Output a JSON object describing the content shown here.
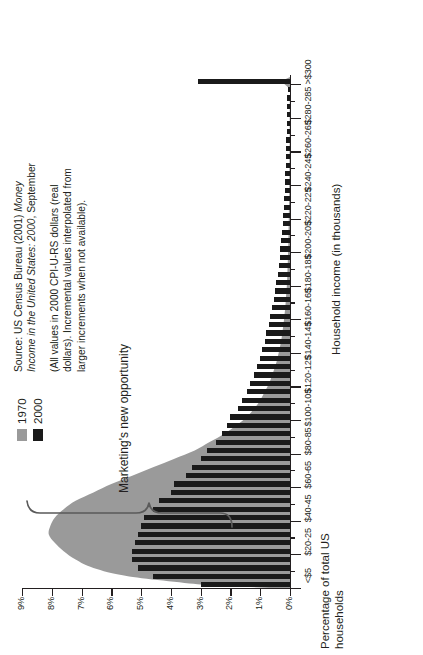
{
  "legend": {
    "items": [
      {
        "label": "1970",
        "color": "#9a9a9a"
      },
      {
        "label": "2000",
        "color": "#1a1a1a"
      }
    ]
  },
  "source_note": {
    "paragraph1_prefix": "Source: US Census Bureau (2001) ",
    "paragraph1_italic": "Money Income in the United States: 2000",
    "paragraph1_suffix": ", September",
    "paragraph2": "(All values in 2000 CPI-U-RS dollars (real dollars). Incremental values interpolated from larger increments when not available)."
  },
  "annotation": {
    "label": "Marketing's new opportunity"
  },
  "chart_data": {
    "type": "bar",
    "title": "",
    "xlabel": "Household income (in thousands)",
    "ylabel": "Percentage of total US households",
    "ylim": [
      0,
      9
    ],
    "ytick_labels": [
      "0%",
      "1%",
      "2%",
      "3%",
      "4%",
      "5%",
      "6%",
      "7%",
      "8%",
      "9%"
    ],
    "ytick_values": [
      0,
      1,
      2,
      3,
      4,
      5,
      6,
      7,
      8,
      9
    ],
    "grid": false,
    "legend_position": "top-right",
    "xtick_labels": [
      "<$5",
      "$20-25",
      "$40-45",
      "$60-65",
      "$80-85",
      "$100-105",
      "$120-125",
      "$140-145",
      "$160-165",
      "$180-185",
      "$200-205",
      "$220-225",
      "$240-245",
      "$260-265",
      "$280-285",
      ">$300"
    ],
    "xtick_positions": [
      0,
      4,
      8,
      12,
      16,
      20,
      24,
      28,
      32,
      36,
      40,
      44,
      48,
      52,
      56,
      60
    ],
    "categories": [
      "<$5",
      "$5-10",
      "$10-15",
      "$15-20",
      "$20-25",
      "$25-30",
      "$30-35",
      "$35-40",
      "$40-45",
      "$45-50",
      "$50-55",
      "$55-60",
      "$60-65",
      "$65-70",
      "$70-75",
      "$75-80",
      "$80-85",
      "$85-90",
      "$90-95",
      "$95-100",
      "$100-105",
      "$105-110",
      "$110-115",
      "$115-120",
      "$120-125",
      "$125-130",
      "$130-135",
      "$135-140",
      "$140-145",
      "$145-150",
      "$150-155",
      "$155-160",
      "$160-165",
      "$165-170",
      "$170-175",
      "$175-180",
      "$180-185",
      "$185-190",
      "$190-195",
      "$195-200",
      "$200-205",
      "$205-210",
      "$210-215",
      "$215-220",
      "$220-225",
      "$225-230",
      "$230-235",
      "$235-240",
      "$240-245",
      "$245-250",
      "$250-255",
      "$255-260",
      "$260-265",
      "$265-270",
      "$270-275",
      "$275-280",
      "$280-285",
      "$285-290",
      "$290-295",
      "$295-300",
      ">$300"
    ],
    "series": [
      {
        "name": "2000",
        "color": "#1a1a1a",
        "values": [
          3.0,
          4.6,
          5.1,
          5.3,
          5.3,
          5.2,
          5.1,
          5.0,
          4.9,
          4.6,
          4.4,
          4.0,
          3.9,
          3.5,
          3.3,
          3.0,
          2.8,
          2.5,
          2.3,
          2.1,
          2.0,
          1.75,
          1.6,
          1.45,
          1.35,
          1.2,
          1.1,
          1.0,
          0.95,
          0.85,
          0.8,
          0.72,
          0.66,
          0.6,
          0.55,
          0.5,
          0.46,
          0.42,
          0.38,
          0.35,
          0.32,
          0.29,
          0.27,
          0.25,
          0.23,
          0.21,
          0.2,
          0.18,
          0.17,
          0.16,
          0.15,
          0.14,
          0.13,
          0.12,
          0.11,
          0.1,
          0.1,
          0.09,
          0.09,
          0.08,
          3.1
        ]
      },
      {
        "name": "1970",
        "color": "#9a9a9a",
        "values": [
          2.9,
          5.4,
          6.6,
          7.2,
          7.6,
          7.9,
          8.1,
          8.05,
          7.9,
          7.6,
          7.2,
          6.6,
          6.0,
          5.3,
          4.6,
          3.9,
          3.2,
          2.7,
          2.2,
          1.8,
          1.45,
          1.2,
          1.0,
          0.85,
          0.7,
          0.6,
          0.5,
          0.42,
          0.36,
          0.3,
          0.26,
          0.22,
          0.19,
          0.16,
          0.14,
          0.12,
          0.1,
          0.09,
          0.08,
          0.07,
          0.06,
          0.055,
          0.05,
          0.045,
          0.04,
          0.035,
          0.03,
          0.028,
          0.025,
          0.022,
          0.02,
          0.018,
          0.016,
          0.014,
          0.013,
          0.012,
          0.011,
          0.01,
          0.009,
          0.008,
          0.3
        ]
      }
    ]
  }
}
